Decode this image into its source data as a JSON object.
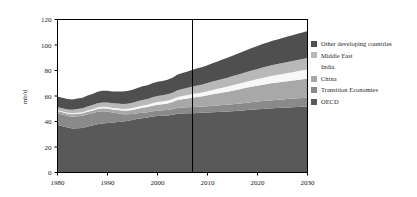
{
  "chart_data": {
    "type": "area",
    "stacked": true,
    "title": "",
    "subtitle": "",
    "xlabel": "",
    "ylabel": "mb/d",
    "xlim": [
      1980,
      2030
    ],
    "ylim": [
      0,
      120
    ],
    "xticks": [
      1980,
      1990,
      2000,
      2010,
      2020,
      2030
    ],
    "yticks": [
      0,
      20,
      40,
      60,
      80,
      100,
      120
    ],
    "grid": false,
    "legend_position": "right",
    "x": [
      1980,
      1981,
      1982,
      1983,
      1984,
      1985,
      1986,
      1987,
      1988,
      1989,
      1990,
      1991,
      1992,
      1993,
      1994,
      1995,
      1996,
      1997,
      1998,
      1999,
      2000,
      2001,
      2002,
      2003,
      2004,
      2005,
      2006,
      2007,
      2008,
      2009,
      2010,
      2011,
      2012,
      2013,
      2014,
      2015,
      2016,
      2017,
      2018,
      2019,
      2020,
      2021,
      2022,
      2023,
      2024,
      2025,
      2026,
      2027,
      2028,
      2029,
      2030
    ],
    "series": [
      {
        "name": "OECD",
        "color": "#595959",
        "values": [
          37.5,
          36.3,
          35.2,
          34.5,
          34.8,
          35.0,
          36.0,
          36.8,
          37.9,
          38.4,
          38.8,
          39.0,
          39.6,
          39.9,
          40.6,
          41.2,
          42.1,
          42.6,
          43.1,
          43.9,
          44.3,
          44.5,
          44.7,
          45.2,
          46.0,
          46.3,
          46.4,
          46.5,
          46.6,
          46.8,
          47.0,
          47.2,
          47.4,
          47.6,
          47.8,
          48.1,
          48.4,
          48.7,
          49.0,
          49.3,
          49.6,
          49.9,
          50.2,
          50.4,
          50.6,
          50.8,
          51.0,
          51.2,
          51.4,
          51.6,
          51.8
        ]
      },
      {
        "name": "Transition Economies",
        "color": "#8a8a8a",
        "values": [
          9.0,
          9.1,
          9.2,
          9.3,
          9.4,
          9.5,
          9.6,
          9.7,
          9.8,
          9.6,
          9.0,
          8.0,
          6.8,
          5.8,
          5.0,
          4.6,
          4.4,
          4.3,
          4.2,
          4.2,
          4.2,
          4.3,
          4.3,
          4.4,
          4.5,
          4.6,
          4.7,
          4.8,
          4.9,
          4.9,
          5.0,
          5.1,
          5.2,
          5.3,
          5.4,
          5.5,
          5.6,
          5.7,
          5.8,
          5.9,
          6.0,
          6.1,
          6.2,
          6.3,
          6.4,
          6.5,
          6.6,
          6.7,
          6.8,
          6.9,
          7.0
        ]
      },
      {
        "name": "China",
        "color": "#a8a8a8",
        "values": [
          1.8,
          1.8,
          1.7,
          1.8,
          1.9,
          1.9,
          2.0,
          2.1,
          2.2,
          2.3,
          2.3,
          2.4,
          2.6,
          2.9,
          3.0,
          3.3,
          3.5,
          3.9,
          4.0,
          4.3,
          4.7,
          4.8,
          5.2,
          5.6,
          6.4,
          6.6,
          7.0,
          7.5,
          7.8,
          8.1,
          8.6,
          9.0,
          9.4,
          9.8,
          10.2,
          10.6,
          11.0,
          11.4,
          11.8,
          12.2,
          12.5,
          12.8,
          13.1,
          13.4,
          13.6,
          13.8,
          14.0,
          14.2,
          14.4,
          14.6,
          14.8
        ]
      },
      {
        "name": "India",
        "color": "#f7f7f7",
        "values": [
          0.6,
          0.7,
          0.7,
          0.8,
          0.8,
          0.9,
          1.0,
          1.0,
          1.1,
          1.2,
          1.2,
          1.2,
          1.3,
          1.3,
          1.4,
          1.5,
          1.6,
          1.7,
          1.8,
          2.0,
          2.1,
          2.1,
          2.2,
          2.3,
          2.4,
          2.5,
          2.6,
          2.7,
          2.9,
          3.0,
          3.2,
          3.4,
          3.6,
          3.8,
          4.0,
          4.2,
          4.4,
          4.6,
          4.8,
          5.0,
          5.2,
          5.4,
          5.6,
          5.8,
          6.0,
          6.2,
          6.4,
          6.6,
          6.8,
          7.0,
          7.2
        ]
      },
      {
        "name": "Middle East",
        "color": "#b8b8b8",
        "values": [
          2.2,
          2.4,
          2.6,
          2.8,
          3.0,
          3.1,
          3.2,
          3.3,
          3.4,
          3.5,
          3.6,
          3.7,
          3.8,
          3.9,
          4.0,
          4.1,
          4.2,
          4.3,
          4.5,
          4.6,
          4.7,
          4.8,
          4.9,
          5.1,
          5.3,
          5.5,
          5.7,
          5.9,
          6.1,
          6.3,
          6.4,
          6.6,
          6.7,
          6.9,
          7.0,
          7.2,
          7.3,
          7.5,
          7.6,
          7.8,
          7.9,
          8.1,
          8.2,
          8.4,
          8.5,
          8.6,
          8.7,
          8.8,
          8.9,
          9.0,
          9.1
        ]
      },
      {
        "name": "Other developing countries",
        "color": "#4f4f4f",
        "values": [
          8.4,
          8.3,
          8.2,
          8.1,
          8.2,
          8.3,
          8.5,
          8.7,
          8.9,
          9.1,
          9.2,
          9.3,
          9.5,
          9.7,
          9.9,
          10.2,
          10.5,
          10.8,
          10.9,
          11.0,
          11.2,
          11.3,
          11.5,
          11.8,
          12.2,
          12.5,
          12.8,
          13.1,
          13.4,
          13.6,
          14.0,
          14.4,
          14.8,
          15.2,
          15.6,
          16.0,
          16.4,
          16.8,
          17.2,
          17.6,
          18.0,
          18.4,
          18.7,
          19.0,
          19.3,
          19.6,
          19.9,
          20.2,
          20.5,
          20.8,
          21.1
        ]
      }
    ],
    "annotations": [
      {
        "name": "history-projection-divider",
        "type": "vline",
        "x": 2007
      }
    ]
  },
  "legend": {
    "items": [
      {
        "label": "Other developing countries",
        "color": "#4f4f4f",
        "swatch": true
      },
      {
        "label": "Middle East",
        "color": "#b8b8b8",
        "swatch": true
      },
      {
        "label": "India",
        "color": "#ffffff",
        "swatch": false
      },
      {
        "label": "China",
        "color": "#a8a8a8",
        "swatch": true
      },
      {
        "label": "Transition Economies",
        "color": "#8a8a8a",
        "swatch": true
      },
      {
        "label": "OECD",
        "color": "#595959",
        "swatch": true
      }
    ]
  },
  "axis": {
    "y_title": "mb/d",
    "y_ticks": [
      "120",
      "100",
      "80",
      "60",
      "40",
      "20",
      "0"
    ],
    "x_ticks": [
      "1980",
      "1990",
      "2000",
      "2010",
      "2020",
      "2030"
    ]
  },
  "colors": {
    "frame": "#000000",
    "divider": "#000000",
    "background": "#ffffff"
  }
}
